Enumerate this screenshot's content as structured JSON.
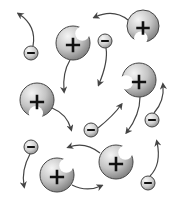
{
  "diagram": {
    "title": "Ions in solution",
    "width": 177,
    "height": 199,
    "colors": {
      "background": "#ffffff",
      "ion_light": "#f2f2f2",
      "ion_dark": "#8a8a8a",
      "outline": "#444444",
      "symbol": "#111111",
      "arrow": "#444444"
    },
    "cations": [
      {
        "id": "cation-1",
        "symbol": "+",
        "cx": 73,
        "cy": 43,
        "r": 17,
        "bite_angle": -45
      },
      {
        "id": "cation-2",
        "symbol": "+",
        "cx": 143,
        "cy": 26,
        "r": 16,
        "bite_angle": 100
      },
      {
        "id": "cation-3",
        "symbol": "+",
        "cx": 37,
        "cy": 100,
        "r": 17,
        "bite_angle": 95
      },
      {
        "id": "cation-4",
        "symbol": "+",
        "cx": 139,
        "cy": 80,
        "r": 17,
        "bite_angle": 170
      },
      {
        "id": "cation-5",
        "symbol": "+",
        "cx": 57,
        "cy": 175,
        "r": 17,
        "bite_angle": -45
      },
      {
        "id": "cation-6",
        "symbol": "+",
        "cx": 116,
        "cy": 162,
        "r": 17,
        "bite_angle": -45
      }
    ],
    "anions": [
      {
        "id": "anion-1",
        "symbol": "−",
        "cx": 31,
        "cy": 53,
        "r": 7
      },
      {
        "id": "anion-2",
        "symbol": "−",
        "cx": 105,
        "cy": 41,
        "r": 7
      },
      {
        "id": "anion-3",
        "symbol": "−",
        "cx": 152,
        "cy": 120,
        "r": 7
      },
      {
        "id": "anion-4",
        "symbol": "−",
        "cx": 91,
        "cy": 130,
        "r": 7
      },
      {
        "id": "anion-5",
        "symbol": "−",
        "cx": 31,
        "cy": 147,
        "r": 7
      },
      {
        "id": "anion-6",
        "symbol": "−",
        "cx": 148,
        "cy": 183,
        "r": 7
      }
    ],
    "arrows": [
      {
        "id": "arrow-anion1",
        "d": "M33 46 C 36 30, 28 20, 19 14"
      },
      {
        "id": "arrow-cation1",
        "d": "M70 60 C 64 70, 63 80, 64 91"
      },
      {
        "id": "arrow-cation2",
        "d": "M128 20 C 118 12, 106 12, 95 17"
      },
      {
        "id": "arrow-anion2",
        "d": "M106 48 C 108 60, 104 72, 99 84"
      },
      {
        "id": "arrow-cation3",
        "d": "M52 108 C 62 112, 68 118, 71 129"
      },
      {
        "id": "arrow-anion4",
        "d": "M98 128 C 108 120, 116 112, 121 105"
      },
      {
        "id": "arrow-cation4",
        "d": "M140 97 C 140 110, 136 120, 127 132"
      },
      {
        "id": "arrow-anion3",
        "d": "M154 113 C 162 104, 164 95, 163 85"
      },
      {
        "id": "arrow-cation6",
        "d": "M100 153 C 90 145, 80 143, 69 147"
      },
      {
        "id": "arrow-anion5",
        "d": "M30 154 C 24 165, 22 175, 24 186"
      },
      {
        "id": "arrow-cation5",
        "d": "M72 185 C 82 190, 92 190, 101 186"
      },
      {
        "id": "arrow-anion6",
        "d": "M150 176 C 158 168, 160 156, 157 142"
      }
    ]
  }
}
